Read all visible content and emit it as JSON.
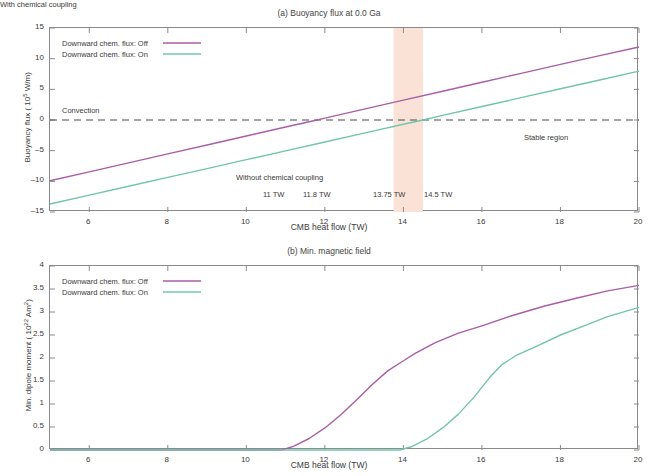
{
  "figure": {
    "xlabel": "CMB heat flow (TW)",
    "xticks": [
      "6",
      "8",
      "10",
      "12",
      "14",
      "16",
      "18",
      "20"
    ],
    "legend": {
      "off_label": "Downward chem. flux: Off",
      "on_label": "Downward chem. flux: On",
      "off_color": "#a95ea6",
      "on_color": "#72c4ae"
    }
  },
  "panel_a": {
    "title": "(a) Buoyancy flux at 0.0 Ga",
    "ylabel_text": "Buoyancy flux ( 10",
    "ylabel_exp": "5",
    "ylabel_tail": " W/m)",
    "yticks": [
      "15",
      "10",
      "5",
      "0",
      "-5",
      "-10",
      "-15"
    ],
    "annotations": {
      "convection": "Convection",
      "stable_region": "Stable region",
      "without_coupling": "Without chemical coupling",
      "with_coupling": "With chemical coupling",
      "tw1": "11 TW",
      "tw2": "11.8 TW",
      "tw3": "13.75 TW",
      "tw4": "14.5 TW"
    },
    "band_color": "#fbe2d6",
    "band_start_tw": 13.75,
    "band_end_tw": 14.5
  },
  "panel_b": {
    "title": "(b) Min. magnetic field",
    "ylabel_text": "Min. dipole moment ( 10",
    "ylabel_exp": "22",
    "ylabel_tail": " Am",
    "ylabel_exp2": "2",
    "ylabel_tail2": ")",
    "yticks": [
      "4",
      "3.5",
      "3",
      "2.5",
      "2",
      "1.5",
      "1",
      "0.5",
      "0"
    ]
  },
  "chart_data": [
    {
      "type": "line",
      "panel": "a",
      "title": "(a) Buoyancy flux at 0.0 Ga",
      "xlabel": "CMB heat flow (TW)",
      "ylabel": "Buoyancy flux (10^5 W/m)",
      "xlim": [
        5,
        20
      ],
      "ylim": [
        -15,
        15
      ],
      "xticks": [
        6,
        8,
        10,
        12,
        14,
        16,
        18,
        20
      ],
      "yticks": [
        -15,
        -10,
        -5,
        0,
        5,
        10,
        15
      ],
      "grid": false,
      "legend_position": "upper-left",
      "series": [
        {
          "name": "Downward chem. flux: Off",
          "color": "#a95ea6",
          "x": [
            5,
            6,
            7,
            8,
            9,
            10,
            11,
            11.8,
            12,
            13,
            14,
            15,
            16,
            17,
            18,
            19,
            20
          ],
          "values": [
            -9.9,
            -8.45,
            -6.99,
            -5.53,
            -4.07,
            -2.61,
            -1.15,
            0.0,
            0.31,
            1.77,
            3.23,
            4.69,
            6.15,
            7.61,
            9.07,
            10.5,
            11.9
          ],
          "zero_crossing_tw": 11.8
        },
        {
          "name": "Downward chem. flux: On",
          "color": "#72c4ae",
          "x": [
            5,
            6,
            7,
            8,
            9,
            10,
            11,
            12,
            13,
            14,
            14.5,
            15,
            16,
            17,
            18,
            19,
            20
          ],
          "values": [
            -13.7,
            -12.25,
            -10.81,
            -9.36,
            -7.92,
            -6.47,
            -5.03,
            -3.58,
            -2.14,
            -0.69,
            0.0,
            0.75,
            2.2,
            3.64,
            5.09,
            6.53,
            7.98
          ],
          "zero_crossing_tw": 14.5
        }
      ],
      "reference_lines": [
        {
          "name": "zero-buoyancy",
          "y": 0,
          "style": "dashed",
          "color": "#4a4a4a"
        }
      ],
      "shaded_bands": [
        {
          "name": "with-chemical-coupling-band",
          "x0": 13.75,
          "x1": 14.5,
          "color": "#fbe2d6"
        }
      ],
      "annotations": [
        {
          "text": "Convection",
          "x": 5.4,
          "y": 1.6
        },
        {
          "text": "Stable region",
          "x": 17.2,
          "y": -3.2
        },
        {
          "text": "Without chemical coupling",
          "x": 9.6,
          "y": -10.6
        },
        {
          "text": "With chemical coupling",
          "x": 13.4,
          "y": -7.4
        },
        {
          "text": "11 TW",
          "x": 10.55,
          "y": -12.8
        },
        {
          "text": "11.8 TW",
          "x": 11.75,
          "y": -12.8
        },
        {
          "text": "13.75 TW",
          "x": 13.6,
          "y": -12.8
        },
        {
          "text": "14.5 TW",
          "x": 14.85,
          "y": -12.8
        }
      ]
    },
    {
      "type": "line",
      "panel": "b",
      "title": "(b) Min. magnetic field",
      "xlabel": "CMB heat flow (TW)",
      "ylabel": "Min. dipole moment (10^22 Am^2)",
      "xlim": [
        5,
        20
      ],
      "ylim": [
        0,
        4
      ],
      "xticks": [
        6,
        8,
        10,
        12,
        14,
        16,
        18,
        20
      ],
      "yticks": [
        0,
        0.5,
        1,
        1.5,
        2,
        2.5,
        3,
        3.5,
        4
      ],
      "grid": false,
      "legend_position": "upper-left",
      "series": [
        {
          "name": "Downward chem. flux: Off",
          "color": "#a95ea6",
          "x": [
            5,
            8,
            10,
            10.9,
            11.2,
            11.6,
            12,
            12.4,
            12.8,
            13.2,
            13.6,
            14,
            14.3,
            14.8,
            15.4,
            16,
            16.8,
            17.6,
            18.4,
            19.2,
            20
          ],
          "values": [
            0,
            0,
            0,
            0,
            0.08,
            0.25,
            0.48,
            0.76,
            1.08,
            1.42,
            1.72,
            1.94,
            2.1,
            2.33,
            2.54,
            2.7,
            2.93,
            3.13,
            3.3,
            3.46,
            3.58
          ]
        },
        {
          "name": "Downward chem. flux: On",
          "color": "#72c4ae",
          "x": [
            5,
            10,
            13.5,
            13.9,
            14.2,
            14.6,
            15,
            15.4,
            15.8,
            16.2,
            16.5,
            16.9,
            17.4,
            18,
            18.6,
            19.2,
            20
          ],
          "values": [
            0,
            0,
            0,
            0,
            0.07,
            0.24,
            0.48,
            0.78,
            1.15,
            1.58,
            1.85,
            2.07,
            2.26,
            2.5,
            2.7,
            2.9,
            3.1
          ]
        }
      ]
    }
  ]
}
